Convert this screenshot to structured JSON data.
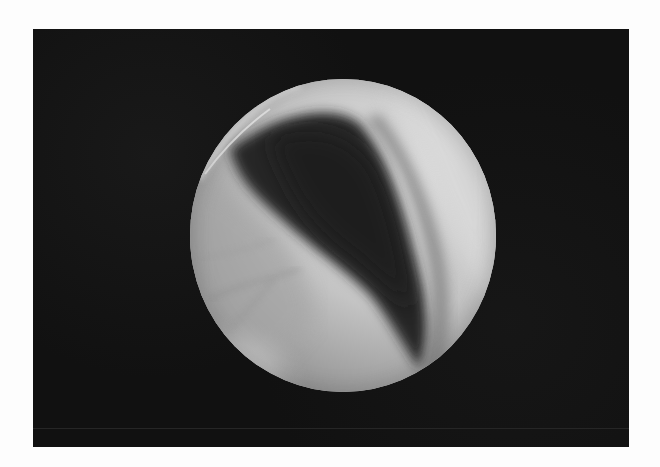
{
  "figure": {
    "type": "endoscopic-photograph",
    "colors": {
      "page_background": "#fdfdfd",
      "frame_background": "#111111",
      "tissue_bright": "#d8d8d8",
      "tissue_mid": "#a8a8a8",
      "lumen_dark": "#2a2a2a",
      "rim_highlight": "#e6e6e6"
    },
    "regions": [
      {
        "name": "bright-upper-right",
        "tone": "light"
      },
      {
        "name": "dark-diagonal-band",
        "tone": "dark"
      },
      {
        "name": "bright-lower-left",
        "tone": "light"
      },
      {
        "name": "top-left-rim-highlight",
        "tone": "very-light"
      }
    ]
  }
}
